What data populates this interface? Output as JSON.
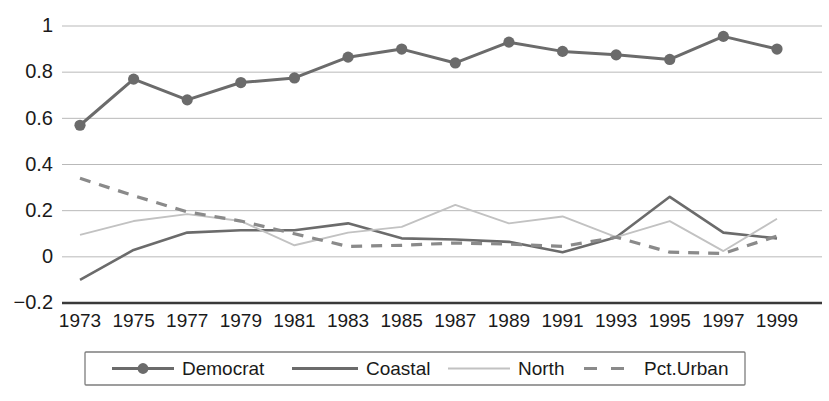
{
  "chart_data": {
    "type": "line",
    "title": "",
    "xlabel": "",
    "ylabel": "",
    "grid": true,
    "legend_position": "bottom",
    "categories": [
      "1973",
      "1975",
      "1977",
      "1979",
      "1981",
      "1983",
      "1985",
      "1987",
      "1989",
      "1991",
      "1993",
      "1995",
      "1997",
      "1999"
    ],
    "x": [
      1973,
      1975,
      1977,
      1979,
      1981,
      1983,
      1985,
      1987,
      1989,
      1991,
      1993,
      1995,
      1997,
      1999
    ],
    "xlim": [
      1973,
      1999
    ],
    "ylim": [
      -0.2,
      1.0
    ],
    "yticks": [
      "1",
      "0.8",
      "0.6",
      "0.4",
      "0.2",
      "0",
      "−0.2"
    ],
    "ytick_values": [
      1,
      0.8,
      0.6,
      0.4,
      0.2,
      0,
      -0.2
    ],
    "series": [
      {
        "name": "Democrat",
        "style": "solid-with-markers",
        "color": "#6b6b6b",
        "values": [
          0.57,
          0.77,
          0.68,
          0.755,
          0.775,
          0.865,
          0.9,
          0.84,
          0.93,
          0.89,
          0.875,
          0.855,
          0.955,
          0.9
        ]
      },
      {
        "name": "Coastal",
        "style": "solid",
        "color": "#6b6b6b",
        "values": [
          -0.1,
          0.03,
          0.105,
          0.115,
          0.115,
          0.145,
          0.08,
          0.075,
          0.065,
          0.02,
          0.085,
          0.26,
          0.105,
          0.08
        ]
      },
      {
        "name": "North",
        "style": "solid-light",
        "color": "#c2c2c2",
        "values": [
          0.095,
          0.155,
          0.185,
          0.155,
          0.05,
          0.105,
          0.13,
          0.225,
          0.145,
          0.175,
          0.085,
          0.155,
          0.025,
          0.165
        ]
      },
      {
        "name": "Pct.Urban",
        "style": "dashed",
        "color": "#8a8a8a",
        "values": [
          0.34,
          0.265,
          0.195,
          0.155,
          0.1,
          0.045,
          0.05,
          0.06,
          0.055,
          0.045,
          0.085,
          0.02,
          0.015,
          0.09
        ]
      }
    ]
  },
  "legend": {
    "entries": [
      {
        "label": "Democrat"
      },
      {
        "label": "Coastal"
      },
      {
        "label": "North"
      },
      {
        "label": "Pct.Urban"
      }
    ]
  },
  "colors": {
    "dark_series": "#6b6b6b",
    "light_series": "#c2c2c2",
    "dashed_series": "#8a8a8a",
    "gridline": "#b9b9b9",
    "axis": "#3a3a3a",
    "text": "#1a1a1a",
    "legend_border": "#7d7d7d",
    "background": "#ffffff"
  }
}
